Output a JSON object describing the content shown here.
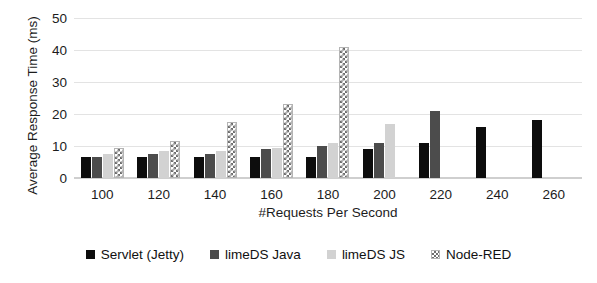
{
  "chart_data": {
    "type": "bar",
    "title": "",
    "clipped_header_text": "",
    "xlabel": "#Requests Per Second",
    "ylabel": "Average Response Time (ms)",
    "categories": [
      "100",
      "120",
      "140",
      "160",
      "180",
      "200",
      "220",
      "240",
      "260"
    ],
    "ylim": [
      0,
      50
    ],
    "yticks": [
      "50",
      "40",
      "30",
      "20",
      "10",
      "0"
    ],
    "ytick_values": [
      50,
      40,
      30,
      20,
      10,
      0
    ],
    "grid": true,
    "legend_position": "bottom",
    "series": [
      {
        "name": "Servlet (Jetty)",
        "color": "#0d0d0d",
        "pattern": "solid",
        "values": [
          6.5,
          6.5,
          6.5,
          6.5,
          6.5,
          9,
          11,
          16,
          18
        ]
      },
      {
        "name": "limeDS Java",
        "color": "#4c4c4c",
        "pattern": "solid",
        "values": [
          6.5,
          7.5,
          7.5,
          9,
          10,
          11,
          21,
          null,
          null
        ]
      },
      {
        "name": "limeDS JS",
        "color": "#d2d2d2",
        "pattern": "solid",
        "values": [
          7.5,
          8.5,
          8.5,
          9.5,
          11,
          17,
          null,
          null,
          null
        ]
      },
      {
        "name": "Node-RED",
        "color": "#6e6e6e",
        "pattern": "checkered",
        "values": [
          9.5,
          11.5,
          17.5,
          23,
          41,
          null,
          null,
          null,
          null
        ]
      }
    ]
  }
}
